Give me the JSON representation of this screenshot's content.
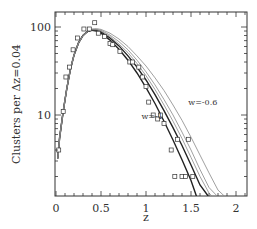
{
  "chart_data": {
    "type": "line",
    "title": "",
    "xlabel": "z",
    "ylabel": "Clusters per Δz=0.04",
    "xlim": [
      0,
      2.12
    ],
    "ylim": [
      1.2,
      148
    ],
    "yscale": "log",
    "grid": false,
    "legend": "inline labels",
    "x_ticks": [
      {
        "value": 0,
        "label": "0"
      },
      {
        "value": 0.5,
        "label": "0.5"
      },
      {
        "value": 1,
        "label": "1"
      },
      {
        "value": 1.5,
        "label": "1.5"
      },
      {
        "value": 2,
        "label": "2"
      }
    ],
    "y_ticks": [
      {
        "value": 10,
        "label": "10"
      },
      {
        "value": 100,
        "label": "100"
      }
    ],
    "annotations": [
      {
        "text": "w=-1",
        "z": 0.95,
        "y": 9
      },
      {
        "text": "w=-0.6",
        "z": 1.47,
        "y": 13
      }
    ],
    "series": [
      {
        "name": "w=-1",
        "style": "bold",
        "points": [
          [
            0.02,
            3.2
          ],
          [
            0.04,
            5.5
          ],
          [
            0.08,
            11
          ],
          [
            0.12,
            20
          ],
          [
            0.16,
            33
          ],
          [
            0.2,
            48
          ],
          [
            0.25,
            66
          ],
          [
            0.3,
            80
          ],
          [
            0.35,
            89
          ],
          [
            0.4,
            92
          ],
          [
            0.45,
            90
          ],
          [
            0.5,
            85
          ],
          [
            0.6,
            71
          ],
          [
            0.7,
            56
          ],
          [
            0.8,
            42
          ],
          [
            0.9,
            30
          ],
          [
            1.0,
            20.5
          ],
          [
            1.1,
            13.5
          ],
          [
            1.2,
            8.5
          ],
          [
            1.3,
            5.2
          ],
          [
            1.4,
            3.1
          ],
          [
            1.5,
            1.8
          ],
          [
            1.56,
            1.2
          ]
        ]
      },
      {
        "name": "w=-0.9",
        "style": "bold",
        "points": [
          [
            0.02,
            3.2
          ],
          [
            0.04,
            5.5
          ],
          [
            0.08,
            11
          ],
          [
            0.12,
            20
          ],
          [
            0.16,
            33
          ],
          [
            0.2,
            48
          ],
          [
            0.25,
            66
          ],
          [
            0.3,
            80
          ],
          [
            0.35,
            89
          ],
          [
            0.4,
            93
          ],
          [
            0.45,
            92
          ],
          [
            0.5,
            88
          ],
          [
            0.6,
            75
          ],
          [
            0.7,
            61
          ],
          [
            0.8,
            47
          ],
          [
            0.9,
            35
          ],
          [
            1.0,
            25
          ],
          [
            1.1,
            17
          ],
          [
            1.2,
            11.2
          ],
          [
            1.3,
            7.2
          ],
          [
            1.4,
            4.5
          ],
          [
            1.5,
            2.7
          ],
          [
            1.6,
            1.6
          ],
          [
            1.69,
            1.2
          ]
        ]
      },
      {
        "name": "w=-0.8",
        "style": "thin",
        "points": [
          [
            0.02,
            3.2
          ],
          [
            0.04,
            5.5
          ],
          [
            0.08,
            11
          ],
          [
            0.12,
            20
          ],
          [
            0.16,
            33
          ],
          [
            0.2,
            48
          ],
          [
            0.25,
            66
          ],
          [
            0.3,
            80
          ],
          [
            0.35,
            89
          ],
          [
            0.4,
            93
          ],
          [
            0.45,
            93
          ],
          [
            0.5,
            90
          ],
          [
            0.6,
            78
          ],
          [
            0.7,
            64
          ],
          [
            0.8,
            51
          ],
          [
            0.9,
            38.5
          ],
          [
            1.0,
            28
          ],
          [
            1.1,
            19.5
          ],
          [
            1.2,
            13
          ],
          [
            1.3,
            8.5
          ],
          [
            1.4,
            5.4
          ],
          [
            1.5,
            3.3
          ],
          [
            1.6,
            2
          ],
          [
            1.7,
            1.3
          ],
          [
            1.73,
            1.2
          ]
        ]
      },
      {
        "name": "w=-0.7",
        "style": "thin",
        "points": [
          [
            0.02,
            3.2
          ],
          [
            0.04,
            5.5
          ],
          [
            0.08,
            11
          ],
          [
            0.12,
            20
          ],
          [
            0.16,
            33
          ],
          [
            0.2,
            48
          ],
          [
            0.25,
            66
          ],
          [
            0.3,
            80
          ],
          [
            0.35,
            89
          ],
          [
            0.4,
            94
          ],
          [
            0.45,
            94
          ],
          [
            0.5,
            92
          ],
          [
            0.6,
            81
          ],
          [
            0.7,
            68
          ],
          [
            0.8,
            55
          ],
          [
            0.9,
            42
          ],
          [
            1.0,
            31
          ],
          [
            1.1,
            22
          ],
          [
            1.2,
            15
          ],
          [
            1.3,
            10
          ],
          [
            1.4,
            6.4
          ],
          [
            1.5,
            4
          ],
          [
            1.6,
            2.4
          ],
          [
            1.7,
            1.5
          ],
          [
            1.79,
            1.2
          ]
        ]
      },
      {
        "name": "w=-0.6",
        "style": "thin",
        "points": [
          [
            0.02,
            3.2
          ],
          [
            0.04,
            5.5
          ],
          [
            0.08,
            11
          ],
          [
            0.12,
            20
          ],
          [
            0.16,
            33
          ],
          [
            0.2,
            48
          ],
          [
            0.25,
            66
          ],
          [
            0.3,
            80
          ],
          [
            0.35,
            90
          ],
          [
            0.4,
            95
          ],
          [
            0.45,
            96
          ],
          [
            0.5,
            94
          ],
          [
            0.6,
            85
          ],
          [
            0.7,
            73
          ],
          [
            0.8,
            60
          ],
          [
            0.9,
            47
          ],
          [
            1.0,
            36
          ],
          [
            1.1,
            26.5
          ],
          [
            1.2,
            19
          ],
          [
            1.3,
            13
          ],
          [
            1.4,
            8.7
          ],
          [
            1.5,
            5.6
          ],
          [
            1.6,
            3.5
          ],
          [
            1.7,
            2.2
          ],
          [
            1.8,
            1.4
          ],
          [
            1.87,
            1.2
          ]
        ]
      }
    ],
    "observed_points": [
      [
        0.03,
        4
      ],
      [
        0.08,
        11
      ],
      [
        0.11,
        27
      ],
      [
        0.15,
        35
      ],
      [
        0.19,
        55
      ],
      [
        0.24,
        75
      ],
      [
        0.31,
        95
      ],
      [
        0.37,
        95
      ],
      [
        0.43,
        112
      ],
      [
        0.47,
        85
      ],
      [
        0.54,
        78
      ],
      [
        0.6,
        65
      ],
      [
        0.63,
        63
      ],
      [
        0.71,
        53
      ],
      [
        0.82,
        40
      ],
      [
        0.85,
        40
      ],
      [
        0.92,
        35
      ],
      [
        0.96,
        27
      ],
      [
        1.0,
        21
      ],
      [
        1.03,
        14
      ],
      [
        1.08,
        10
      ],
      [
        1.13,
        9
      ],
      [
        1.16,
        10
      ],
      [
        1.2,
        8
      ],
      [
        1.28,
        4
      ],
      [
        1.35,
        5.3
      ],
      [
        1.47,
        5.3
      ],
      [
        1.32,
        2
      ],
      [
        1.4,
        2
      ],
      [
        1.44,
        2
      ],
      [
        1.52,
        2
      ]
    ]
  },
  "colors": {
    "frame": "#333333",
    "bold_curve": "#222222",
    "thin_curve": "#888888",
    "marker": "#333333",
    "background": "#ffffff"
  }
}
